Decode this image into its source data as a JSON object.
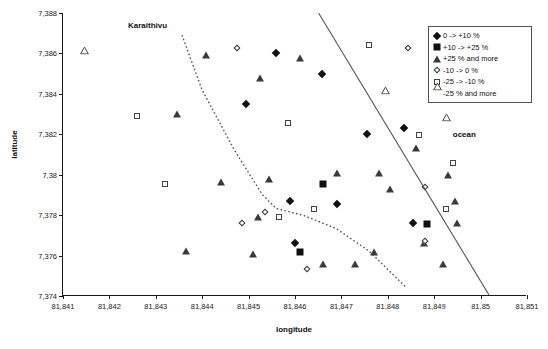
{
  "chart_data": {
    "type": "scatter",
    "title": "",
    "xlabel": "longitude",
    "ylabel": "latitude",
    "xlim": [
      81.841,
      81.851
    ],
    "ylim": [
      7.374,
      7.388
    ],
    "xticks": [
      "81,841",
      "81,842",
      "81,843",
      "81,844",
      "81,845",
      "81,846",
      "81,847",
      "81,848",
      "81,849",
      "81,85",
      "81,851"
    ],
    "xtick_values": [
      81.841,
      81.842,
      81.843,
      81.844,
      81.845,
      81.846,
      81.847,
      81.848,
      81.849,
      81.85,
      81.851
    ],
    "yticks": [
      "7,374",
      "7,376",
      "7,378",
      "7,38",
      "7,382",
      "7,384",
      "7,386",
      "7,388"
    ],
    "ytick_values": [
      7.374,
      7.376,
      7.378,
      7.38,
      7.382,
      7.384,
      7.386,
      7.388
    ],
    "grid": false,
    "legend_position": "top-right",
    "legend": [
      {
        "label": "0 -> +10 %",
        "marker": "filled-diamond"
      },
      {
        "label": "+10 -> +25 %",
        "marker": "filled-square"
      },
      {
        "label": "+25 % and more",
        "marker": "filled-triangle"
      },
      {
        "label": "-10 -> 0 %",
        "marker": "open-diamond"
      },
      {
        "label": "-25 -> -10 %",
        "marker": "open-square"
      },
      {
        "label": "-25 % and more",
        "marker": "open-triangle"
      }
    ],
    "annotations": [
      {
        "text": "Karaithivu",
        "x": 81.8424,
        "y": 7.3876
      },
      {
        "text": "ocean",
        "x": 81.8494,
        "y": 7.3822
      }
    ],
    "series": [
      {
        "name": "0 -> +10 %",
        "marker": "filled-diamond",
        "points": [
          {
            "x": 81.84558,
            "y": 7.38603
          },
          {
            "x": 81.84658,
            "y": 7.385
          },
          {
            "x": 81.84495,
            "y": 7.3835
          },
          {
            "x": 81.84755,
            "y": 7.382
          },
          {
            "x": 81.8459,
            "y": 7.3787
          },
          {
            "x": 81.8469,
            "y": 7.37855
          },
          {
            "x": 81.84835,
            "y": 7.3823
          },
          {
            "x": 81.846,
            "y": 7.3766
          },
          {
            "x": 81.84855,
            "y": 7.3776
          }
        ]
      },
      {
        "name": "+10 -> +25 %",
        "marker": "filled-square",
        "points": [
          {
            "x": 81.8466,
            "y": 7.37955
          },
          {
            "x": 81.84885,
            "y": 7.37755
          },
          {
            "x": 81.8461,
            "y": 7.3762
          }
        ]
      },
      {
        "name": "+25 % and more",
        "marker": "filled-triangle",
        "points": [
          {
            "x": 81.84408,
            "y": 7.3859
          },
          {
            "x": 81.84525,
            "y": 7.3848
          },
          {
            "x": 81.8461,
            "y": 7.38575
          },
          {
            "x": 81.84345,
            "y": 7.383
          },
          {
            "x": 81.8469,
            "y": 7.3801
          },
          {
            "x": 81.8478,
            "y": 7.3801
          },
          {
            "x": 81.8444,
            "y": 7.37965
          },
          {
            "x": 81.84545,
            "y": 7.3798
          },
          {
            "x": 81.84805,
            "y": 7.3793
          },
          {
            "x": 81.8486,
            "y": 7.3813
          },
          {
            "x": 81.8493,
            "y": 7.38
          },
          {
            "x": 81.84945,
            "y": 7.3787
          },
          {
            "x": 81.8495,
            "y": 7.3776
          },
          {
            "x": 81.8452,
            "y": 7.3779
          },
          {
            "x": 81.84878,
            "y": 7.3766
          },
          {
            "x": 81.8477,
            "y": 7.3762
          },
          {
            "x": 81.8473,
            "y": 7.3756
          },
          {
            "x": 81.8492,
            "y": 7.3756
          },
          {
            "x": 81.8466,
            "y": 7.3756
          },
          {
            "x": 81.8451,
            "y": 7.3761
          },
          {
            "x": 81.84365,
            "y": 7.37625
          }
        ]
      },
      {
        "name": "-10 -> 0 %",
        "marker": "open-diamond",
        "points": [
          {
            "x": 81.84475,
            "y": 7.38625
          },
          {
            "x": 81.84843,
            "y": 7.38625
          },
          {
            "x": 81.8488,
            "y": 7.3794
          },
          {
            "x": 81.84535,
            "y": 7.37815
          },
          {
            "x": 81.84485,
            "y": 7.3776
          },
          {
            "x": 81.8488,
            "y": 7.3767
          },
          {
            "x": 81.84625,
            "y": 7.37535
          }
        ]
      },
      {
        "name": "-25 -> -10 %",
        "marker": "open-square",
        "points": [
          {
            "x": 81.8476,
            "y": 7.3864
          },
          {
            "x": 81.84585,
            "y": 7.38255
          },
          {
            "x": 81.8432,
            "y": 7.37955
          },
          {
            "x": 81.84868,
            "y": 7.38195
          },
          {
            "x": 81.8494,
            "y": 7.3806
          },
          {
            "x": 81.84925,
            "y": 7.3783
          },
          {
            "x": 81.8464,
            "y": 7.3783
          },
          {
            "x": 81.84565,
            "y": 7.3779
          },
          {
            "x": 81.8426,
            "y": 7.3829
          }
        ]
      },
      {
        "name": "-25 % and more",
        "marker": "open-triangle",
        "points": [
          {
            "x": 81.84145,
            "y": 7.3858
          },
          {
            "x": 81.84945,
            "y": 7.38585
          },
          {
            "x": 81.84795,
            "y": 7.38385
          },
          {
            "x": 81.84925,
            "y": 7.3825
          }
        ]
      }
    ],
    "boundary_lines": [
      {
        "name": "ocean-boundary",
        "style": "solid",
        "points": [
          [
            81.84652,
            7.388
          ],
          [
            81.8502,
            7.374
          ]
        ]
      },
      {
        "name": "coastline",
        "style": "dotted",
        "points": [
          [
            81.84357,
            7.3869
          ],
          [
            81.844,
            7.3842
          ],
          [
            81.8447,
            7.3812
          ],
          [
            81.8453,
            7.379
          ],
          [
            81.8456,
            7.3783
          ],
          [
            81.8462,
            7.37795
          ],
          [
            81.8469,
            7.3773
          ],
          [
            81.8476,
            7.3762
          ],
          [
            81.848,
            7.3753
          ],
          [
            81.8484,
            7.3744
          ]
        ]
      }
    ]
  }
}
